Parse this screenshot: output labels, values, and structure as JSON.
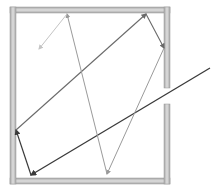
{
  "diagram": {
    "title": "",
    "colors": {
      "wall_fill": "#b8b8b8",
      "wall_highlight": "#dcdcdc",
      "ray_dark": "#3a3a3a",
      "ray_mid": "#6a6a6a",
      "ray_light": "#9a9a9a",
      "ray_faint": "#c4c4c4",
      "background": "#ffffff"
    },
    "enclosure": {
      "outer": {
        "x": 10,
        "y": 7,
        "width": 160,
        "height": 177
      },
      "wall_thickness": 6,
      "opening": {
        "side": "right",
        "y_start": 88,
        "y_end": 104
      }
    },
    "ray_segments": [
      {
        "id": "incident",
        "from": [
          210,
          68
        ],
        "to": [
          31,
          175
        ],
        "shade": "dark"
      },
      {
        "id": "reflect-1",
        "from": [
          31,
          175
        ],
        "to": [
          16,
          130
        ],
        "shade": "dark"
      },
      {
        "id": "reflect-2",
        "from": [
          16,
          130
        ],
        "to": [
          146,
          14
        ],
        "shade": "mid"
      },
      {
        "id": "reflect-3",
        "from": [
          146,
          14
        ],
        "to": [
          164,
          48
        ],
        "shade": "mid"
      },
      {
        "id": "reflect-4",
        "from": [
          164,
          48
        ],
        "to": [
          107,
          174
        ],
        "shade": "light"
      },
      {
        "id": "reflect-5",
        "from": [
          107,
          174
        ],
        "to": [
          67,
          14
        ],
        "shade": "light"
      },
      {
        "id": "reflect-6",
        "from": [
          67,
          14
        ],
        "to": [
          39,
          49
        ],
        "shade": "faint"
      }
    ]
  }
}
